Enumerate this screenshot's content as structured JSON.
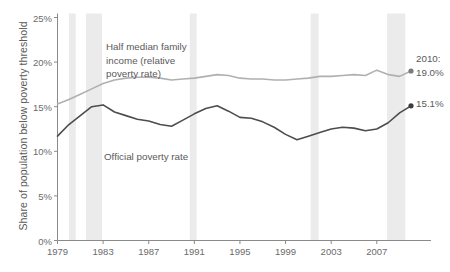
{
  "chart_data": {
    "type": "line",
    "title": "",
    "xlabel": "",
    "ylabel": "Share of population below poverty threshold",
    "xlim": [
      1979,
      2010
    ],
    "ylim": [
      0,
      25
    ],
    "ytick_labels": [
      "0%",
      "5%",
      "10%",
      "15%",
      "20%",
      "25%"
    ],
    "ytick_values": [
      0,
      5,
      10,
      15,
      20,
      25
    ],
    "xtick_labels": [
      "1979",
      "1983",
      "1987",
      "1991",
      "1995",
      "1999",
      "2003",
      "2007"
    ],
    "xtick_values": [
      1979,
      1983,
      1987,
      1991,
      1995,
      1999,
      2003,
      2007
    ],
    "grid": false,
    "legend_position": "inline-annotations",
    "x": [
      1979,
      1980,
      1981,
      1982,
      1983,
      1984,
      1985,
      1986,
      1987,
      1988,
      1989,
      1990,
      1991,
      1992,
      1993,
      1994,
      1995,
      1996,
      1997,
      1998,
      1999,
      2000,
      2001,
      2002,
      2003,
      2004,
      2005,
      2006,
      2007,
      2008,
      2009,
      2010
    ],
    "series": [
      {
        "name": "Half median family income (relative poverty rate)",
        "color": "#b0b0b0",
        "values": [
          15.3,
          15.8,
          16.4,
          17.0,
          17.6,
          18.0,
          18.2,
          18.3,
          18.3,
          18.2,
          18.0,
          18.1,
          18.2,
          18.4,
          18.6,
          18.5,
          18.2,
          18.1,
          18.1,
          18.0,
          18.0,
          18.1,
          18.2,
          18.4,
          18.4,
          18.5,
          18.6,
          18.5,
          19.1,
          18.6,
          18.4,
          19.0
        ],
        "end_label": "2010:\n19.0%",
        "end_value": 19.0
      },
      {
        "name": "Official poverty rate",
        "color": "#4d4d4d",
        "values": [
          11.7,
          13.0,
          14.0,
          15.0,
          15.2,
          14.4,
          14.0,
          13.6,
          13.4,
          13.0,
          12.8,
          13.5,
          14.2,
          14.8,
          15.1,
          14.5,
          13.8,
          13.7,
          13.3,
          12.7,
          11.9,
          11.3,
          11.7,
          12.1,
          12.5,
          12.7,
          12.6,
          12.3,
          12.5,
          13.2,
          14.3,
          15.1
        ],
        "end_label": "15.1%",
        "end_value": 15.1
      }
    ],
    "recession_bands": [
      {
        "start": 1980.0,
        "end": 1980.6
      },
      {
        "start": 1981.5,
        "end": 1982.9
      },
      {
        "start": 1990.6,
        "end": 1991.2
      },
      {
        "start": 2001.2,
        "end": 2001.9
      },
      {
        "start": 2007.9,
        "end": 2009.5
      }
    ],
    "annotations": [
      {
        "name": "relative-poverty-annotation",
        "text": "Half median family\nincome (relative\npoverty rate)",
        "x_px": 106,
        "y_px": 40
      },
      {
        "name": "official-poverty-annotation",
        "text": "Official poverty rate",
        "x_px": 104,
        "y_px": 150
      }
    ],
    "end_annotations": [
      {
        "name": "relative-end-label",
        "text": "2010:\n19.0%",
        "x_px": 416,
        "y_px": 52
      },
      {
        "name": "official-end-label",
        "text": "15.1%",
        "x_px": 416,
        "y_px": 97
      }
    ]
  }
}
